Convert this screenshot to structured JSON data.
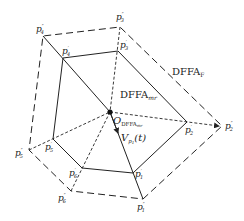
{
  "diagram": {
    "center": {
      "id": "O",
      "label": "O",
      "subscript": "DFFA",
      "subscript2": "mr",
      "x": 110,
      "y": 112
    },
    "inner_region_label": {
      "main": "DFFA",
      "sub": "mr"
    },
    "outer_region_label": {
      "main": "DFFA",
      "sub": "F"
    },
    "velocity_label": {
      "main": "V",
      "sub": "p",
      "subsub": "1",
      "arg": "(t)"
    },
    "inner_points": [
      {
        "id": "p1p",
        "base": "p",
        "sub": "1",
        "sup": "'",
        "x": 133,
        "y": 173
      },
      {
        "id": "p2p",
        "base": "p",
        "sub": "2",
        "sup": "'",
        "x": 187,
        "y": 122
      },
      {
        "id": "p3p",
        "base": "p",
        "sub": "3",
        "sup": "'",
        "x": 118,
        "y": 51
      },
      {
        "id": "p4p",
        "base": "p",
        "sub": "4",
        "sup": "'",
        "x": 63,
        "y": 58
      },
      {
        "id": "p5p",
        "base": "p",
        "sub": "5",
        "sup": "'",
        "x": 53,
        "y": 139
      },
      {
        "id": "p6p",
        "base": "p",
        "sub": "6",
        "sup": "'",
        "x": 82,
        "y": 168
      }
    ],
    "outer_points": [
      {
        "id": "p1pp",
        "base": "p",
        "sub": "1",
        "sup": "''",
        "x": 143,
        "y": 199
      },
      {
        "id": "p2pp",
        "base": "p",
        "sub": "2",
        "sup": "''",
        "x": 222,
        "y": 126
      },
      {
        "id": "p3pp",
        "base": "p",
        "sub": "3",
        "sup": "''",
        "x": 120,
        "y": 27
      },
      {
        "id": "p4pp",
        "base": "p",
        "sub": "4",
        "sup": "''",
        "x": 43,
        "y": 36
      },
      {
        "id": "p5pp",
        "base": "p",
        "sub": "5",
        "sup": "''",
        "x": 29,
        "y": 150
      },
      {
        "id": "p6pp",
        "base": "p",
        "sub": "6",
        "sup": "''",
        "x": 71,
        "y": 191
      }
    ],
    "labels": {
      "p1p": "p",
      "p2p": "p",
      "p3p": "p",
      "p4p": "p",
      "p5p": "p",
      "p6p": "p",
      "p1pp": "p",
      "p2pp": "p",
      "p3pp": "p",
      "p4pp": "p",
      "p5pp": "p",
      "p6pp": "p"
    },
    "subs": {
      "1": "1",
      "2": "2",
      "3": "3",
      "4": "4",
      "5": "5",
      "6": "6"
    },
    "sup_single": "′",
    "sup_double": "″",
    "text": {
      "dffa": "DFFA",
      "mr": "mr",
      "F": "F",
      "O": "O",
      "V": "V",
      "p": "p",
      "one": "1",
      "t": "(t)"
    }
  }
}
